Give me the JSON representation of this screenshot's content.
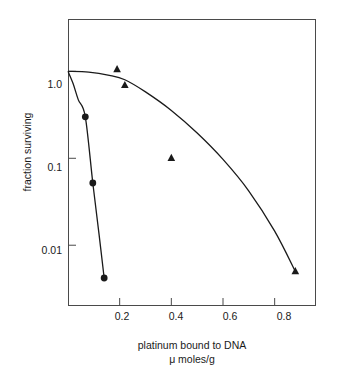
{
  "chart_data": {
    "type": "scatter",
    "title": "",
    "xlabel": "platinum bound to DNA",
    "xlabel_line2": "μ moles/g",
    "ylabel": "fraction surviving",
    "xlim": [
      0.0,
      0.96
    ],
    "ylim": [
      0.002,
      4.0
    ],
    "yscale": "log",
    "xscale": "linear",
    "grid": false,
    "legend": false,
    "xticks": [
      0.2,
      0.4,
      0.6,
      0.8
    ],
    "xtick_labels": [
      "0.2",
      "0.4",
      "0.6",
      "0.8"
    ],
    "yticks": [
      1.0,
      0.1,
      0.01
    ],
    "ytick_labels": [
      "1.0",
      "0.1",
      "0.01"
    ],
    "series": [
      {
        "name": "circles",
        "marker": "circle",
        "color": "#1a1a1a",
        "x": [
          0.067,
          0.096,
          0.14
        ],
        "y": [
          0.3,
          0.052,
          0.0042
        ],
        "curve_x": [
          0.0,
          0.02,
          0.04,
          0.067,
          0.096,
          0.12,
          0.14
        ],
        "curve_y": [
          1.0,
          0.72,
          0.47,
          0.3,
          0.052,
          0.0135,
          0.0042
        ]
      },
      {
        "name": "triangles",
        "marker": "triangle",
        "color": "#1a1a1a",
        "x": [
          0.19,
          0.22,
          0.4,
          0.88
        ],
        "y": [
          1.05,
          0.69,
          0.1,
          0.005
        ],
        "curve_x": [
          0.0,
          0.08,
          0.16,
          0.22,
          0.3,
          0.4,
          0.5,
          0.6,
          0.7,
          0.8,
          0.88
        ],
        "curve_y": [
          1.0,
          0.98,
          0.9,
          0.8,
          0.58,
          0.355,
          0.195,
          0.097,
          0.042,
          0.0145,
          0.005
        ]
      }
    ]
  },
  "axes": {
    "ytick_labels": [
      "1.0",
      "0.1",
      "0.01"
    ],
    "xtick_labels": [
      "0.2",
      "0.4",
      "0.6",
      "0.8"
    ],
    "ylabel": "fraction surviving",
    "xlabel_line1": "platinum bound to DNA",
    "xlabel_line2": "μ moles/g"
  }
}
